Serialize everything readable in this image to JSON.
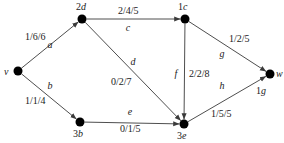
{
  "diagram": {
    "type": "directed-flow-network",
    "nodes": [
      {
        "id": "v",
        "label": "v",
        "x": 18,
        "y": 71,
        "lx": 4,
        "ly": 75,
        "italic": true
      },
      {
        "id": "d",
        "label": "2d",
        "x": 82,
        "y": 19,
        "lx": 76,
        "ly": 10,
        "italic": true
      },
      {
        "id": "c",
        "label": "1c",
        "x": 185,
        "y": 19,
        "lx": 178,
        "ly": 10,
        "italic": true
      },
      {
        "id": "w",
        "label": "w",
        "x": 270,
        "y": 74,
        "lx": 276,
        "ly": 77,
        "italic": true
      },
      {
        "id": "g",
        "label": "1g",
        "x": 270,
        "y": 74,
        "lx": 256,
        "ly": 94,
        "italic": true,
        "shared_with": "w"
      },
      {
        "id": "b",
        "label": "3b",
        "x": 80,
        "y": 122,
        "lx": 73,
        "ly": 137,
        "italic": true
      },
      {
        "id": "e",
        "label": "3e",
        "x": 184,
        "y": 124,
        "lx": 177,
        "ly": 139,
        "italic": true
      }
    ],
    "edges": [
      {
        "id": "a",
        "from": "v",
        "to": "d",
        "name": "a",
        "flow": "1/6/6",
        "x1": 18,
        "y1": 71,
        "x2": 82,
        "y2": 19,
        "nx": 50,
        "ny": 48,
        "fx": 25,
        "fy": 40
      },
      {
        "id": "b",
        "from": "v",
        "to": "b",
        "name": "b",
        "flow": "1/1/4",
        "x1": 18,
        "y1": 71,
        "x2": 80,
        "y2": 122,
        "nx": 50,
        "ny": 89,
        "fx": 25,
        "fy": 104
      },
      {
        "id": "c",
        "from": "d",
        "to": "c",
        "name": "c",
        "flow": "2/4/5",
        "x1": 82,
        "y1": 19,
        "x2": 185,
        "y2": 19,
        "nx": 128,
        "ny": 31,
        "fx": 118,
        "fy": 14
      },
      {
        "id": "d",
        "from": "d",
        "to": "e",
        "name": "d",
        "flow": "0/2/7",
        "x1": 82,
        "y1": 19,
        "x2": 184,
        "y2": 124,
        "nx": 133,
        "ny": 65,
        "fx": 111,
        "fy": 85
      },
      {
        "id": "e",
        "from": "b",
        "to": "e",
        "name": "e",
        "flow": "0/1/5",
        "x1": 80,
        "y1": 122,
        "x2": 184,
        "y2": 124,
        "nx": 130,
        "ny": 115,
        "fx": 120,
        "fy": 132
      },
      {
        "id": "f",
        "from": "c",
        "to": "e",
        "name": "f",
        "flow": "2/2/8",
        "x1": 185,
        "y1": 19,
        "x2": 184,
        "y2": 124,
        "nx": 176,
        "ny": 77,
        "fx": 189,
        "fy": 77
      },
      {
        "id": "g",
        "from": "c",
        "to": "w",
        "name": "g",
        "flow": "1/2/5",
        "x1": 185,
        "y1": 19,
        "x2": 270,
        "y2": 74,
        "nx": 222,
        "ny": 57,
        "fx": 229,
        "fy": 42
      },
      {
        "id": "h",
        "from": "e",
        "to": "w",
        "name": "h",
        "flow": "1/5/5",
        "x1": 184,
        "y1": 124,
        "x2": 270,
        "y2": 74,
        "nx": 222,
        "ny": 89,
        "fx": 211,
        "fy": 117
      }
    ],
    "colors": {
      "stroke": "#3a3a3a",
      "node": "#000000",
      "text": "#1a1a1a",
      "background": "#ffffff"
    }
  }
}
